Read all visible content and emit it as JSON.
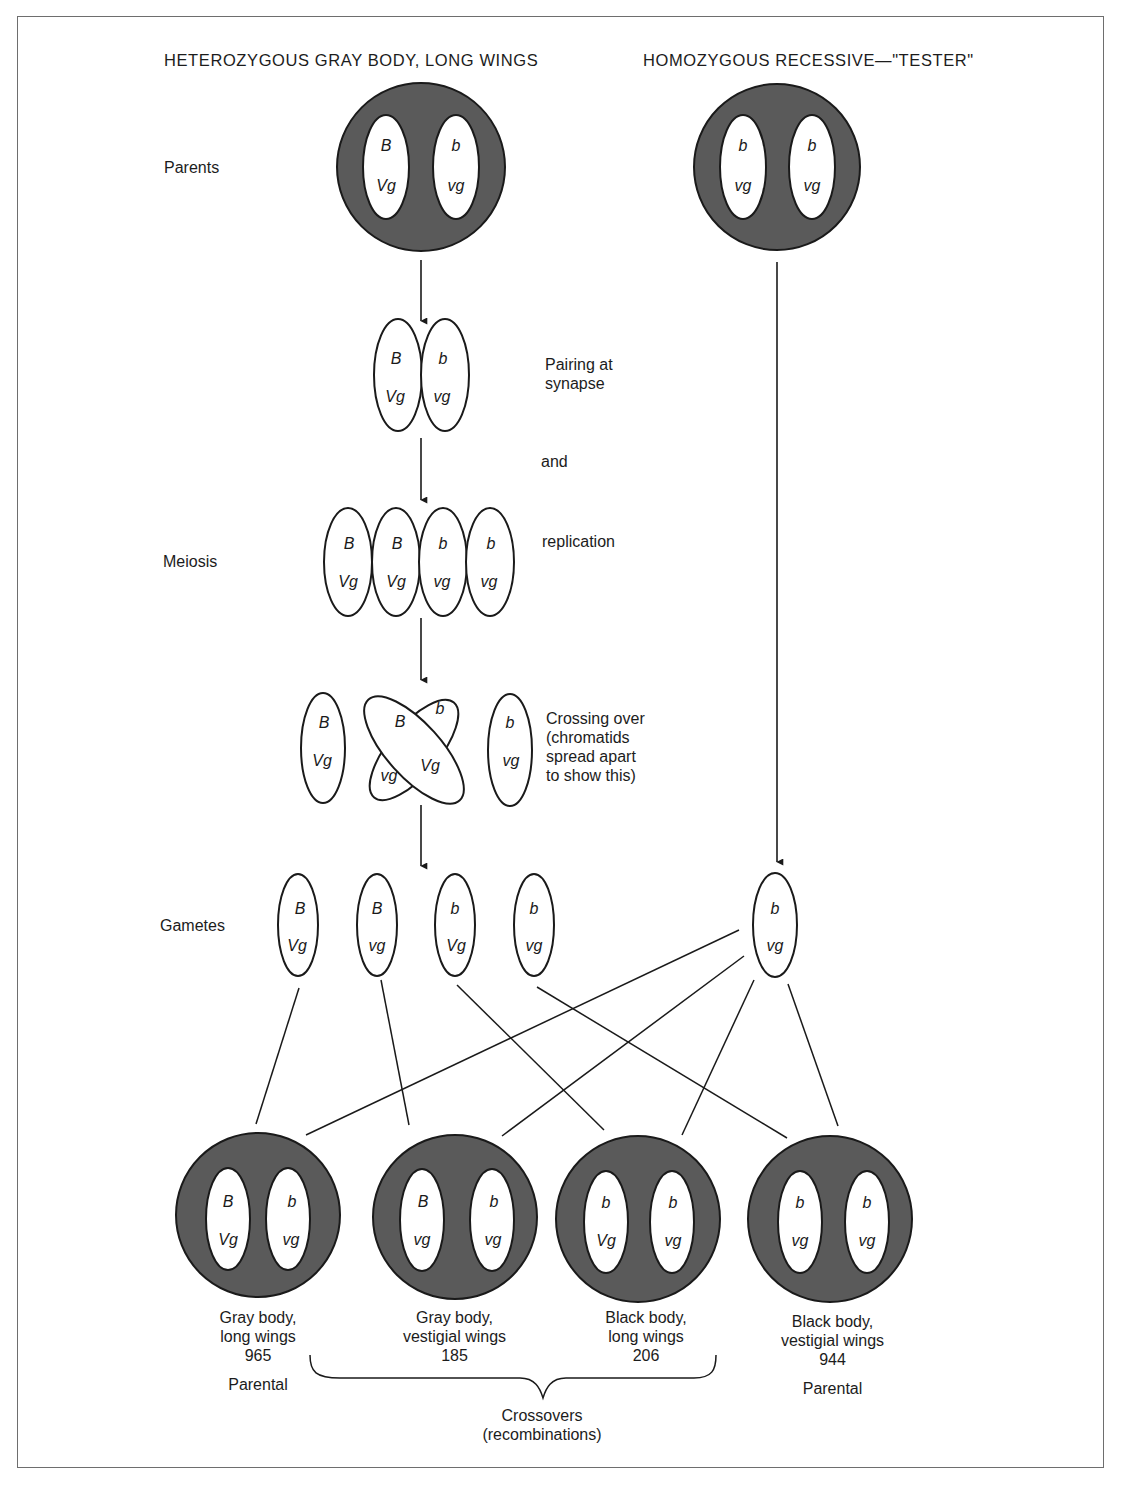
{
  "headers": {
    "left": "HETEROZYGOUS GRAY BODY, LONG WINGS",
    "right": "HOMOZYGOUS RECESSIVE—\"TESTER\""
  },
  "row_labels": {
    "parents": "Parents",
    "meiosis": "Meiosis",
    "gametes": "Gametes"
  },
  "step_labels": {
    "pairing_line1": "Pairing at",
    "pairing_line2": "synapse",
    "and": "and",
    "replication": "replication",
    "crossing_line1": "Crossing over",
    "crossing_line2": "(chromatids",
    "crossing_line3": "spread apart",
    "crossing_line4": "to show this)"
  },
  "parents": [
    {
      "name": "heterozygous-parent",
      "chromosomes": [
        [
          "B",
          "Vg"
        ],
        [
          "b",
          "vg"
        ]
      ]
    },
    {
      "name": "tester-parent",
      "chromosomes": [
        [
          "b",
          "vg"
        ],
        [
          "b",
          "vg"
        ]
      ]
    }
  ],
  "synapse": [
    [
      "B",
      "Vg"
    ],
    [
      "b",
      "vg"
    ]
  ],
  "replication": [
    [
      "B",
      "Vg"
    ],
    [
      "B",
      "Vg"
    ],
    [
      "b",
      "vg"
    ],
    [
      "b",
      "vg"
    ]
  ],
  "crossing_over": {
    "left": [
      "B",
      "Vg"
    ],
    "crossed_a": [
      "B",
      "Vg"
    ],
    "crossed_b": [
      "b",
      "vg"
    ],
    "right": [
      "b",
      "vg"
    ]
  },
  "gametes": [
    [
      "B",
      "Vg"
    ],
    [
      "B",
      "vg"
    ],
    [
      "b",
      "Vg"
    ],
    [
      "b",
      "vg"
    ]
  ],
  "tester_gamete": [
    "b",
    "vg"
  ],
  "offspring": [
    {
      "chromosomes": [
        [
          "B",
          "Vg"
        ],
        [
          "b",
          "vg"
        ]
      ],
      "line1": "Gray body,",
      "line2": "long wings",
      "count": "965",
      "type": "Parental"
    },
    {
      "chromosomes": [
        [
          "B",
          "vg"
        ],
        [
          "b",
          "vg"
        ]
      ],
      "line1": "Gray body,",
      "line2": "vestigial wings",
      "count": "185",
      "type": ""
    },
    {
      "chromosomes": [
        [
          "b",
          "Vg"
        ],
        [
          "b",
          "vg"
        ]
      ],
      "line1": "Black body,",
      "line2": "long wings",
      "count": "206",
      "type": ""
    },
    {
      "chromosomes": [
        [
          "b",
          "vg"
        ],
        [
          "b",
          "vg"
        ]
      ],
      "line1": "Black body,",
      "line2": "vestigial wings",
      "count": "944",
      "type": "Parental"
    }
  ],
  "brace_label": {
    "line1": "Crossovers",
    "line2": "(recombinations)"
  },
  "colors": {
    "cell_fill": "#5a5a5a",
    "chromosome_fill": "#ffffff",
    "stroke": "#1a1a1a",
    "frame": "#6e6e6e"
  }
}
